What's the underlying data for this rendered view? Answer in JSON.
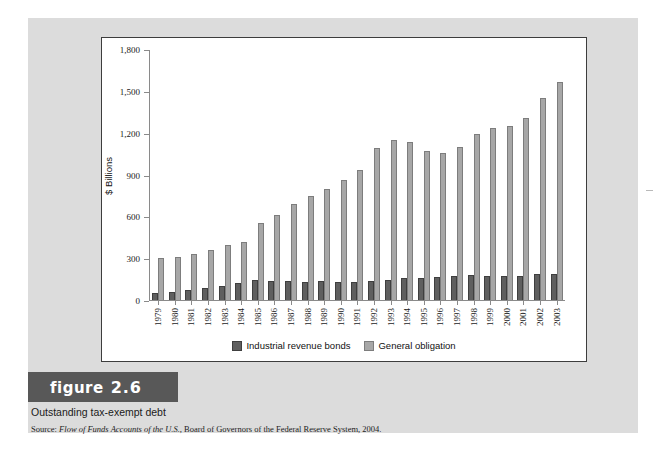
{
  "figure": {
    "badge_word": "figure",
    "badge_number": "2.6",
    "title": "Outstanding tax-exempt debt",
    "source_prefix": "Source: ",
    "source_italic": "Flow of Funds Accounts of the U.S.",
    "source_rest": ", Board of Governors of the Federal Reserve System, 2004."
  },
  "colors": {
    "industrial_revenue_bonds": "#5f5f5f",
    "general_obligation": "#a7a7a7",
    "page_panel": "#dcdcdc",
    "chart_background": "#ffffff",
    "axis": "#8a8a8a",
    "badge_background": "#585858"
  },
  "chart_data": {
    "type": "bar",
    "title": "Outstanding tax-exempt debt",
    "xlabel": "",
    "ylabel": "$ Billions",
    "ylim": [
      0,
      1800
    ],
    "yticks": [
      0,
      300,
      600,
      900,
      1200,
      1500,
      1800
    ],
    "ytick_labels": [
      "0",
      "300",
      "600",
      "900",
      "1,200",
      "1,500",
      "1,800"
    ],
    "grid": false,
    "legend_position": "bottom",
    "categories": [
      "1979",
      "1980",
      "1981",
      "1982",
      "1983",
      "1984",
      "1985",
      "1986",
      "1987",
      "1988",
      "1989",
      "1990",
      "1991",
      "1992",
      "1993",
      "1994",
      "1995",
      "1996",
      "1997",
      "1998",
      "1999",
      "2000",
      "2001",
      "2002",
      "2003"
    ],
    "series": [
      {
        "name": "Industrial revenue bonds",
        "color": "#5f5f5f",
        "values": [
          50,
          58,
          72,
          90,
          103,
          122,
          143,
          135,
          136,
          133,
          134,
          131,
          129,
          137,
          143,
          155,
          160,
          163,
          170,
          178,
          176,
          174,
          176,
          186,
          188
        ]
      },
      {
        "name": "General obligation",
        "color": "#a7a7a7",
        "values": [
          302,
          312,
          328,
          358,
          393,
          420,
          551,
          610,
          688,
          752,
          800,
          862,
          935,
          1095,
          1150,
          1135,
          1075,
          1055,
          1105,
          1195,
          1240,
          1255,
          1310,
          1455,
          1570
        ]
      }
    ]
  },
  "legend": {
    "items": [
      {
        "label": "Industrial revenue bonds"
      },
      {
        "label": "General obligation"
      }
    ]
  }
}
